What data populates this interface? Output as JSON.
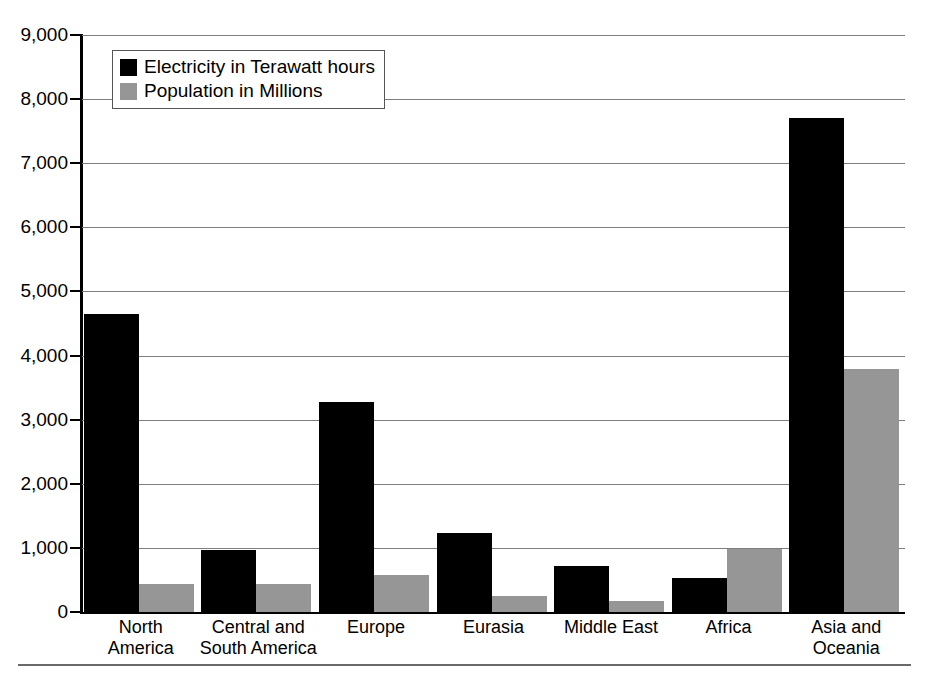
{
  "chart_data": {
    "type": "bar",
    "title": "",
    "subtitle": "",
    "xlabel": "",
    "ylabel": "",
    "grid": true,
    "legend_position": "top-left",
    "ylim": [
      0,
      9000
    ],
    "ytick_step": 1000,
    "ytick_labels": [
      "9,000",
      "8,000",
      "7,000",
      "6,000",
      "5,000",
      "4,000",
      "3,000",
      "2,000",
      "1,000",
      "0"
    ],
    "ytick_values": [
      9000,
      8000,
      7000,
      6000,
      5000,
      4000,
      3000,
      2000,
      1000,
      0
    ],
    "categories": [
      "North\nAmerica",
      "Central and\nSouth America",
      "Europe",
      "Eurasia",
      "Middle East",
      "Africa",
      "Asia and\nOceania"
    ],
    "series": [
      {
        "name": "Electricity in Terawatt hours",
        "color": "#000000",
        "values": [
          4650,
          960,
          3270,
          1240,
          710,
          530,
          7700
        ]
      },
      {
        "name": "Population in Millions",
        "color": "#969696",
        "values": [
          440,
          440,
          570,
          250,
          170,
          990,
          3790
        ]
      }
    ]
  },
  "legend": {
    "items": [
      {
        "label": "Electricity in Terawatt hours",
        "swatch": "black-square-swatch"
      },
      {
        "label": "Population in Millions",
        "swatch": "gray-square-swatch"
      }
    ]
  }
}
